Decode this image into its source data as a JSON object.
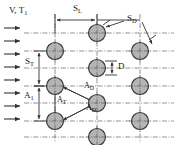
{
  "figure": {
    "background_color": "#ffffff",
    "tube_fill_color": "#b5b5b5",
    "tube_stroke_color": "#3a3a3a",
    "line_color": "#555555",
    "text_color": "#1a1a1a",
    "width": 174,
    "height": 145
  },
  "labels": {
    "inlet": {
      "text": "V, T",
      "sub": "1",
      "x": 10,
      "y": 7
    },
    "s_longitudinal": {
      "text": "S",
      "sub": "L",
      "x": 74,
      "y": 6
    },
    "s_diagonal": {
      "text": "S",
      "sub": "D",
      "x": 128,
      "y": 17
    },
    "s_transverse": {
      "text": "S",
      "sub": "T",
      "x": 32,
      "y": 58
    },
    "diameter": {
      "text": "D",
      "sub": "",
      "x": 116,
      "y": 63
    },
    "a_inlet": {
      "text": "A",
      "sub": "1",
      "x": 31,
      "y": 92
    },
    "a_transverse": {
      "text": "A",
      "sub": "T",
      "x": 58,
      "y": 96
    },
    "a_diagonal_upper": {
      "text": "A",
      "sub": "D",
      "x": 86,
      "y": 84
    },
    "a_diagonal_lower": {
      "text": "A",
      "sub": "D",
      "x": 88,
      "y": 103
    }
  },
  "flow_arrows": {
    "count": 7,
    "direction": "right",
    "x_start": 5,
    "x_end": 22,
    "y_positions": [
      28,
      41,
      54,
      67,
      80,
      93,
      106,
      119
    ],
    "description": "Incoming cross-flow arrows"
  },
  "tubes": {
    "diameter_px": 15,
    "columns_x": [
      55,
      97,
      140
    ],
    "rows_description": "Staggered rows: column 1 and 3 at rows A, column 2 offset by half pitch",
    "positions": [
      {
        "cx": 97,
        "cy": 33
      },
      {
        "cx": 55,
        "cy": 51
      },
      {
        "cx": 140,
        "cy": 51
      },
      {
        "cx": 97,
        "cy": 68
      },
      {
        "cx": 55,
        "cy": 86
      },
      {
        "cx": 140,
        "cy": 86
      },
      {
        "cx": 97,
        "cy": 103
      },
      {
        "cx": 55,
        "cy": 121
      },
      {
        "cx": 140,
        "cy": 121
      },
      {
        "cx": 97,
        "cy": 137
      }
    ]
  },
  "dimension_lines": {
    "s_l": {
      "x1": 57,
      "x2": 97,
      "y": 19,
      "orientation": "horizontal"
    },
    "s_d": {
      "x1": 106,
      "y1": 27,
      "x2": 150,
      "y2": 43,
      "orientation": "diagonal"
    },
    "s_t": {
      "x": 38,
      "y1": 51,
      "y2": 86,
      "orientation": "vertical"
    },
    "a_1": {
      "x": 38,
      "y1": 86,
      "y2": 121,
      "orientation": "vertical"
    },
    "d": {
      "x": 111,
      "y1": 61,
      "y2": 75,
      "orientation": "vertical"
    },
    "a_t": {
      "x": 55,
      "y1": 86,
      "y2": 121,
      "orientation": "vertical"
    },
    "a_d_upper": {
      "x1": 62,
      "y1": 86,
      "x2": 90,
      "y2": 103,
      "orientation": "diagonal"
    },
    "a_d_lower": {
      "x1": 62,
      "y1": 121,
      "x2": 90,
      "y2": 103,
      "orientation": "diagonal"
    }
  },
  "centerlines": {
    "vertical_x": [
      55,
      97,
      140
    ],
    "horizontal_y": [
      33,
      51,
      68,
      86,
      103,
      121,
      137
    ],
    "style": "dash-dot"
  }
}
